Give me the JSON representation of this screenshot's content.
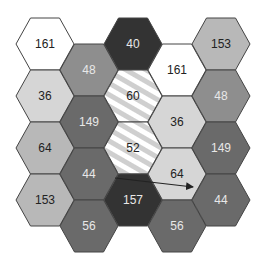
{
  "caption": "",
  "palette": {
    "white": "#ffffff",
    "light": "#d6d6d6",
    "mid_light": "#b8b8b8",
    "mid": "#8e8e8e",
    "dark": "#6a6a6a",
    "darkest": "#333333",
    "stroke": "#444444",
    "text_dark": "#222222",
    "text_light": "#e8e8e8",
    "stripe": "#cfcfcf"
  },
  "cells": [
    {
      "col": 0,
      "row": 0,
      "value": "161",
      "fill": "white",
      "text": "text_dark"
    },
    {
      "col": 0,
      "row": 1,
      "value": "36",
      "fill": "light",
      "text": "text_dark"
    },
    {
      "col": 0,
      "row": 2,
      "value": "64",
      "fill": "mid_light",
      "text": "text_dark"
    },
    {
      "col": 0,
      "row": 3,
      "value": "153",
      "fill": "mid_light",
      "text": "text_dark"
    },
    {
      "col": 1,
      "row": 0,
      "value": "48",
      "fill": "mid",
      "text": "text_light"
    },
    {
      "col": 1,
      "row": 1,
      "value": "149",
      "fill": "dark",
      "text": "text_light"
    },
    {
      "col": 1,
      "row": 2,
      "value": "44",
      "fill": "dark",
      "text": "text_light"
    },
    {
      "col": 1,
      "row": 3,
      "value": "56",
      "fill": "dark",
      "text": "text_light"
    },
    {
      "col": 2,
      "row": 0,
      "value": "40",
      "fill": "darkest",
      "text": "text_light"
    },
    {
      "col": 2,
      "row": 1,
      "value": "60",
      "fill": "striped",
      "text": "text_dark"
    },
    {
      "col": 2,
      "row": 2,
      "value": "52",
      "fill": "striped",
      "text": "text_dark"
    },
    {
      "col": 2,
      "row": 3,
      "value": "157",
      "fill": "darkest",
      "text": "text_light"
    },
    {
      "col": 3,
      "row": 0,
      "value": "161",
      "fill": "white",
      "text": "text_dark"
    },
    {
      "col": 3,
      "row": 1,
      "value": "36",
      "fill": "light",
      "text": "text_dark"
    },
    {
      "col": 3,
      "row": 2,
      "value": "64",
      "fill": "light",
      "text": "text_dark"
    },
    {
      "col": 3,
      "row": 3,
      "value": "56",
      "fill": "dark",
      "text": "text_light"
    },
    {
      "col": 4,
      "row": 0,
      "value": "153",
      "fill": "mid_light",
      "text": "text_dark"
    },
    {
      "col": 4,
      "row": 1,
      "value": "48",
      "fill": "mid",
      "text": "text_light"
    },
    {
      "col": 4,
      "row": 2,
      "value": "149",
      "fill": "dark",
      "text": "text_light"
    },
    {
      "col": 4,
      "row": 3,
      "value": "44",
      "fill": "dark",
      "text": "text_light"
    }
  ],
  "arrow": {
    "from": {
      "col": 2,
      "row": 3
    },
    "to": {
      "col": 4,
      "row": 3
    }
  }
}
